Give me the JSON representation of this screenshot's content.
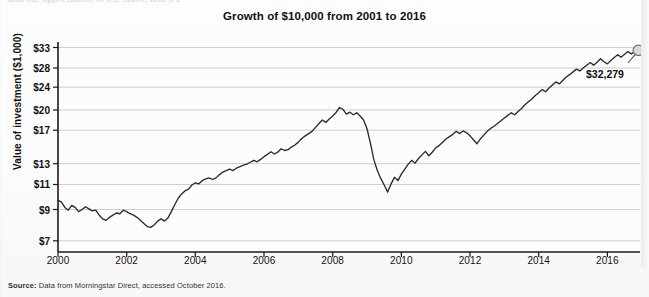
{
  "top_sliver_text": "and the appreciation of the stock, and it's",
  "chart_title": "Growth of $10,000 from 2001 to 2016",
  "footer": {
    "source_label": "Source:",
    "source_text": " Data from Morningstar Direct, accessed October 2016."
  },
  "callout": {
    "value_label": "$32,279",
    "x": 586,
    "y": 68
  },
  "colors": {
    "line": "#2b2b2b",
    "grid": "#c8c8c8",
    "axis": "#1a1a1a",
    "marker_fill": "#d9d9d9",
    "marker_stroke": "#6e6e6e",
    "background": "#fbfbfb"
  },
  "chart_data": {
    "type": "line",
    "title": "Growth of $10,000 from 2001 to 2016",
    "xlabel": "",
    "ylabel": "Value of investment ($1,000)",
    "yscale": "log",
    "grid": true,
    "legend": null,
    "ylim": [
      6.4,
      34.5
    ],
    "xlim": [
      2000.0,
      2016.95
    ],
    "yticks": [
      7,
      9,
      11,
      13,
      17,
      20,
      24,
      28,
      33
    ],
    "ytick_labels": [
      "$7",
      "$9",
      "$11",
      "$13",
      "$17",
      "$20",
      "$24",
      "$28",
      "$33"
    ],
    "xticks": [
      2000,
      2002,
      2004,
      2006,
      2008,
      2010,
      2012,
      2014,
      2016
    ],
    "xtick_labels": [
      "2000",
      "2002",
      "2004",
      "2006",
      "2008",
      "2010",
      "2012",
      "2014",
      "2016"
    ],
    "end_point": {
      "x": 2016.9,
      "y": 32.279,
      "label": "$32,279",
      "marker": "circle"
    },
    "series": [
      {
        "name": "Value of investment ($1,000)",
        "x": [
          2000.0,
          2000.1,
          2000.2,
          2000.3,
          2000.4,
          2000.5,
          2000.6,
          2000.7,
          2000.8,
          2000.9,
          2001.0,
          2001.1,
          2001.2,
          2001.3,
          2001.4,
          2001.5,
          2001.6,
          2001.7,
          2001.8,
          2001.9,
          2002.0,
          2002.1,
          2002.2,
          2002.3,
          2002.4,
          2002.5,
          2002.6,
          2002.7,
          2002.8,
          2002.9,
          2003.0,
          2003.1,
          2003.2,
          2003.3,
          2003.4,
          2003.5,
          2003.6,
          2003.7,
          2003.8,
          2003.9,
          2004.0,
          2004.1,
          2004.2,
          2004.3,
          2004.4,
          2004.5,
          2004.6,
          2004.7,
          2004.8,
          2004.9,
          2005.0,
          2005.1,
          2005.2,
          2005.3,
          2005.4,
          2005.5,
          2005.6,
          2005.7,
          2005.8,
          2005.9,
          2006.0,
          2006.1,
          2006.2,
          2006.3,
          2006.4,
          2006.5,
          2006.6,
          2006.7,
          2006.8,
          2006.9,
          2007.0,
          2007.1,
          2007.2,
          2007.3,
          2007.4,
          2007.5,
          2007.6,
          2007.7,
          2007.8,
          2007.9,
          2008.0,
          2008.1,
          2008.2,
          2008.3,
          2008.4,
          2008.5,
          2008.6,
          2008.7,
          2008.8,
          2008.9,
          2009.0,
          2009.1,
          2009.2,
          2009.3,
          2009.4,
          2009.5,
          2009.6,
          2009.7,
          2009.8,
          2009.9,
          2010.0,
          2010.1,
          2010.2,
          2010.3,
          2010.4,
          2010.5,
          2010.6,
          2010.7,
          2010.8,
          2010.9,
          2011.0,
          2011.1,
          2011.2,
          2011.3,
          2011.4,
          2011.5,
          2011.6,
          2011.7,
          2011.8,
          2011.9,
          2012.0,
          2012.1,
          2012.2,
          2012.3,
          2012.4,
          2012.5,
          2012.6,
          2012.7,
          2012.8,
          2012.9,
          2013.0,
          2013.1,
          2013.2,
          2013.3,
          2013.4,
          2013.5,
          2013.6,
          2013.7,
          2013.8,
          2013.9,
          2014.0,
          2014.1,
          2014.2,
          2014.3,
          2014.4,
          2014.5,
          2014.6,
          2014.7,
          2014.8,
          2014.9,
          2015.0,
          2015.1,
          2015.2,
          2015.3,
          2015.4,
          2015.5,
          2015.6,
          2015.7,
          2015.8,
          2015.9,
          2016.0,
          2016.1,
          2016.2,
          2016.3,
          2016.4,
          2016.5,
          2016.6,
          2016.7,
          2016.8,
          2016.9
        ],
        "y": [
          9.7,
          9.55,
          9.15,
          8.95,
          9.3,
          9.15,
          8.85,
          9.0,
          9.2,
          9.05,
          8.9,
          8.95,
          8.6,
          8.35,
          8.25,
          8.45,
          8.6,
          8.75,
          8.7,
          8.95,
          8.85,
          8.7,
          8.6,
          8.45,
          8.25,
          8.05,
          7.85,
          7.8,
          7.95,
          8.2,
          8.35,
          8.2,
          8.4,
          8.85,
          9.35,
          9.85,
          10.2,
          10.45,
          10.6,
          10.95,
          11.15,
          11.05,
          11.35,
          11.5,
          11.6,
          11.45,
          11.6,
          11.9,
          12.15,
          12.3,
          12.45,
          12.3,
          12.55,
          12.7,
          12.85,
          12.95,
          13.15,
          13.35,
          13.2,
          13.45,
          13.75,
          14.0,
          14.3,
          14.05,
          14.25,
          14.65,
          14.45,
          14.55,
          14.85,
          15.1,
          15.45,
          15.9,
          16.25,
          16.55,
          16.85,
          17.4,
          17.95,
          18.45,
          18.1,
          18.6,
          19.05,
          19.6,
          20.4,
          20.1,
          19.35,
          19.65,
          19.25,
          19.55,
          19.05,
          18.45,
          17.2,
          15.3,
          13.4,
          12.3,
          11.55,
          10.95,
          10.35,
          11.05,
          11.65,
          11.35,
          11.95,
          12.45,
          12.95,
          13.35,
          13.05,
          13.55,
          13.95,
          14.35,
          13.85,
          14.25,
          14.75,
          15.05,
          15.45,
          15.85,
          16.15,
          16.45,
          16.85,
          16.55,
          16.9,
          16.65,
          16.25,
          15.75,
          15.25,
          15.85,
          16.35,
          16.85,
          17.25,
          17.55,
          17.95,
          18.35,
          18.75,
          19.15,
          19.55,
          19.25,
          19.75,
          20.25,
          20.85,
          21.35,
          21.85,
          22.45,
          22.95,
          23.55,
          23.15,
          23.85,
          24.45,
          25.05,
          24.65,
          25.35,
          26.05,
          26.55,
          27.15,
          27.75,
          27.35,
          28.05,
          28.65,
          29.25,
          28.65,
          29.35,
          30.15,
          29.45,
          28.95,
          29.75,
          30.45,
          31.15,
          30.55,
          31.25,
          31.95,
          31.35,
          32.05,
          32.279
        ]
      }
    ]
  }
}
